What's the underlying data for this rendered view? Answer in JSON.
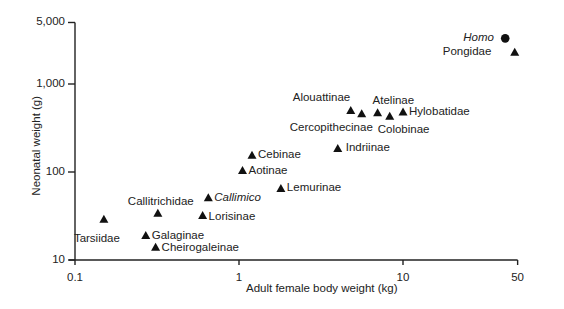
{
  "chart_data": {
    "type": "scatter",
    "title": "",
    "xlabel": "Adult female body weight (kg)",
    "ylabel": "Neonatal weight (g)",
    "xscale": "log",
    "yscale": "log",
    "xlim": [
      0.1,
      50
    ],
    "ylim": [
      10,
      5000
    ],
    "xticks": [
      0.1,
      1,
      10,
      50
    ],
    "xtick_labels": [
      "0.1",
      "1",
      "10",
      "50"
    ],
    "yticks": [
      10,
      100,
      1000,
      5000
    ],
    "ytick_labels": [
      "10",
      "100",
      "1,000",
      "5,000"
    ],
    "grid": false,
    "legend": null,
    "series": [
      {
        "name": "Primate taxa",
        "marker": "triangle",
        "points": [
          {
            "label": "Tarsiidae",
            "x": 0.15,
            "y": 29
          },
          {
            "label": "Callitrichidae",
            "x": 0.32,
            "y": 34
          },
          {
            "label": "Galaginae",
            "x": 0.27,
            "y": 19
          },
          {
            "label": "Cheirogaleinae",
            "x": 0.31,
            "y": 14
          },
          {
            "label": "Callimico",
            "x": 0.65,
            "y": 51,
            "italic": true
          },
          {
            "label": "Lorisinae",
            "x": 0.6,
            "y": 32
          },
          {
            "label": "Aotinae",
            "x": 1.05,
            "y": 104
          },
          {
            "label": "Cebinae",
            "x": 1.2,
            "y": 155
          },
          {
            "label": "Lemurinae",
            "x": 1.8,
            "y": 65
          },
          {
            "label": "Indriinae",
            "x": 4.0,
            "y": 185
          },
          {
            "label": "Alouattinae",
            "x": 4.8,
            "y": 500
          },
          {
            "label": "Cercopithecinae",
            "x": 5.6,
            "y": 460
          },
          {
            "label": "Atelinae",
            "x": 7.0,
            "y": 470
          },
          {
            "label": "Colobinae",
            "x": 8.3,
            "y": 430
          },
          {
            "label": "Hylobatidae",
            "x": 10.0,
            "y": 480
          },
          {
            "label": "Pongidae",
            "x": 48.0,
            "y": 2300
          }
        ]
      },
      {
        "name": "Homo",
        "marker": "circle",
        "points": [
          {
            "label": "Homo",
            "x": 42.0,
            "y": 3300,
            "italic": true
          }
        ]
      }
    ]
  }
}
